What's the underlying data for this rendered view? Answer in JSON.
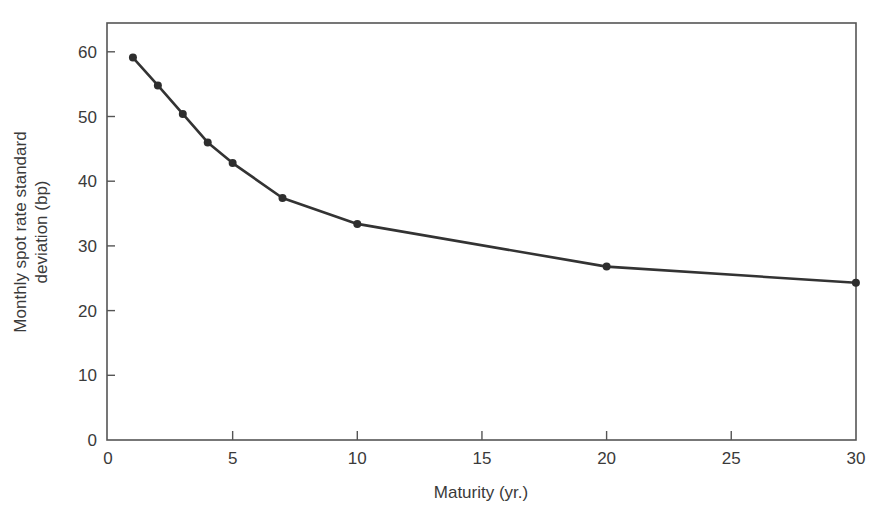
{
  "chart_data": {
    "type": "line",
    "title": "",
    "xlabel": "Maturity (yr.)",
    "ylabel_lines": [
      "Monthly spot rate standard",
      "deviation (bp)"
    ],
    "ylabel": "Monthly spot rate standard deviation (bp)",
    "xlim": [
      0,
      30
    ],
    "ylim": [
      0,
      65
    ],
    "xticks": [
      0,
      5,
      10,
      15,
      20,
      25,
      30
    ],
    "yticks": [
      0,
      10,
      20,
      30,
      40,
      50,
      60
    ],
    "grid": false,
    "legend": null,
    "series": [
      {
        "name": "Monthly spot rate standard deviation",
        "x": [
          1,
          2,
          3,
          4,
          5,
          7,
          10,
          20,
          30
        ],
        "values": [
          59.1,
          54.8,
          50.4,
          46.0,
          42.8,
          37.4,
          33.4,
          26.8,
          24.3
        ],
        "color": "#333333",
        "marker": "circle"
      }
    ]
  },
  "plot_area": {
    "left": 107,
    "right": 856,
    "top": 23,
    "bottom": 440,
    "x_px_per_unit": 24.93,
    "y_px_per_unit": 6.47
  }
}
